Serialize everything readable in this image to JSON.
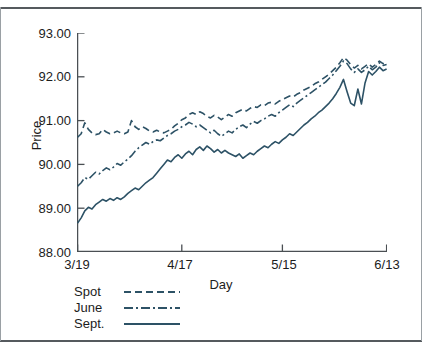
{
  "chart_data": {
    "type": "line",
    "title": "",
    "xlabel": "Day",
    "ylabel": "Price",
    "grid": false,
    "legend_position": "below-left",
    "xlim": [
      0,
      86
    ],
    "ylim": [
      88.0,
      93.0
    ],
    "ytick_labels": [
      "93.00",
      "92.00",
      "91.00",
      "90.00",
      "89.00",
      "88.00"
    ],
    "ytick_values": [
      93.0,
      92.0,
      91.0,
      90.0,
      89.0,
      88.0
    ],
    "xtick_labels": [
      "3/19",
      "4/17",
      "5/15",
      "6/13"
    ],
    "xtick_values": [
      0,
      29,
      57,
      86
    ],
    "line_color": "#2d5266",
    "series": [
      {
        "name": "Spot",
        "style": "dashed",
        "values": [
          90.62,
          90.7,
          90.95,
          90.8,
          90.72,
          90.68,
          90.7,
          90.8,
          90.74,
          90.7,
          90.72,
          90.76,
          90.72,
          90.7,
          90.74,
          91.0,
          90.86,
          90.8,
          90.86,
          90.82,
          90.76,
          90.74,
          90.78,
          90.74,
          90.72,
          90.76,
          90.8,
          90.88,
          90.94,
          91.02,
          91.06,
          91.14,
          91.18,
          91.14,
          91.2,
          91.16,
          91.1,
          91.06,
          91.12,
          91.08,
          91.02,
          91.08,
          91.14,
          91.1,
          91.18,
          91.22,
          91.26,
          91.22,
          91.28,
          91.32,
          91.3,
          91.36,
          91.34,
          91.4,
          91.42,
          91.38,
          91.44,
          91.48,
          91.52,
          91.56,
          91.54,
          91.6,
          91.64,
          91.7,
          91.74,
          91.78,
          91.84,
          91.88,
          91.94,
          92.0,
          92.06,
          92.14,
          92.22,
          92.32,
          92.44,
          92.38,
          92.28,
          92.2,
          92.26,
          92.18,
          92.24,
          92.3,
          92.22,
          92.28,
          92.36,
          92.3,
          92.32
        ]
      },
      {
        "name": "June",
        "style": "dash-dot",
        "values": [
          89.5,
          89.58,
          89.7,
          89.66,
          89.74,
          89.82,
          89.78,
          89.86,
          89.92,
          89.88,
          89.94,
          90.02,
          89.98,
          90.06,
          90.12,
          90.2,
          90.3,
          90.38,
          90.44,
          90.5,
          90.46,
          90.52,
          90.56,
          90.54,
          90.6,
          90.66,
          90.7,
          90.76,
          90.8,
          90.86,
          90.9,
          90.96,
          90.92,
          90.86,
          90.9,
          90.84,
          90.78,
          90.72,
          90.78,
          90.7,
          90.64,
          90.7,
          90.76,
          90.72,
          90.8,
          90.86,
          90.9,
          90.84,
          90.92,
          90.98,
          90.94,
          91.0,
          91.04,
          91.1,
          91.14,
          91.1,
          91.18,
          91.24,
          91.3,
          91.36,
          91.32,
          91.4,
          91.46,
          91.52,
          91.58,
          91.64,
          91.7,
          91.76,
          91.82,
          91.88,
          91.96,
          92.04,
          92.14,
          92.24,
          92.36,
          92.3,
          92.18,
          92.1,
          92.18,
          92.1,
          92.16,
          92.24,
          92.16,
          92.22,
          92.32,
          92.26,
          92.28
        ]
      },
      {
        "name": "Sept.",
        "style": "solid",
        "values": [
          88.66,
          88.78,
          88.94,
          89.02,
          88.98,
          89.08,
          89.14,
          89.2,
          89.16,
          89.22,
          89.18,
          89.24,
          89.2,
          89.26,
          89.34,
          89.4,
          89.46,
          89.42,
          89.5,
          89.58,
          89.64,
          89.7,
          89.8,
          89.9,
          90.0,
          90.1,
          90.06,
          90.16,
          90.22,
          90.14,
          90.24,
          90.3,
          90.22,
          90.34,
          90.4,
          90.32,
          90.42,
          90.36,
          90.28,
          90.34,
          90.26,
          90.32,
          90.26,
          90.22,
          90.18,
          90.24,
          90.14,
          90.2,
          90.26,
          90.22,
          90.3,
          90.36,
          90.42,
          90.38,
          90.46,
          90.52,
          90.48,
          90.56,
          90.62,
          90.7,
          90.66,
          90.74,
          90.82,
          90.9,
          90.96,
          91.04,
          91.1,
          91.18,
          91.24,
          91.32,
          91.4,
          91.5,
          91.62,
          91.76,
          91.94,
          91.66,
          91.4,
          91.34,
          91.72,
          91.38,
          91.86,
          92.12,
          92.04,
          92.12,
          92.22,
          92.14,
          92.18
        ]
      }
    ]
  },
  "legend": {
    "items": [
      {
        "label": "Spot"
      },
      {
        "label": "June"
      },
      {
        "label": "Sept."
      }
    ]
  }
}
